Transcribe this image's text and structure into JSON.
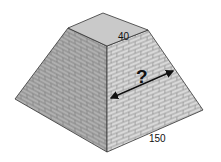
{
  "diagram": {
    "type": "truncated-pyramid",
    "texture": "brick",
    "labels": {
      "top_edge": "40",
      "base_edge": "150",
      "unknown": "?"
    },
    "colors": {
      "top_face": "#c9c9c9",
      "left_face": "#a8a8a8",
      "right_face": "#d4d4d4",
      "mortar": "#8a8a8a",
      "edge": "#333333",
      "arrow": "#111111"
    }
  }
}
